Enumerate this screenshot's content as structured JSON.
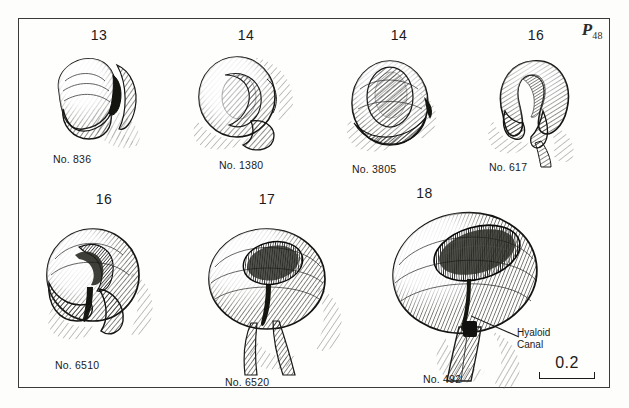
{
  "plate": {
    "mark_prefix": "P",
    "mark_number": "48"
  },
  "figures": [
    {
      "stage": "13",
      "specimen": "No. 836",
      "shape": "optic-vesicle-lateral",
      "description": "Optic vesicle, stage 13"
    },
    {
      "stage": "14",
      "specimen": "No. 1380",
      "shape": "optic-vesicle-invaginating",
      "description": "Optic vesicle beginning invagination, stage 14"
    },
    {
      "stage": "14",
      "specimen": "No. 3805",
      "shape": "optic-vesicle-lens-placode",
      "description": "Optic vesicle with lens placode, stage 14"
    },
    {
      "stage": "16",
      "specimen": "No. 617",
      "shape": "optic-cup-horseshoe",
      "description": "Optic cup, horseshoe form, stage 16"
    },
    {
      "stage": "16",
      "specimen": "No. 6510",
      "shape": "optic-cup-choroid-fissure",
      "description": "Optic cup with choroid fissure, stage 16"
    },
    {
      "stage": "17",
      "specimen": "No. 6520",
      "shape": "optic-cup-lens-vesicle",
      "description": "Optic cup with lens vesicle, stage 17"
    },
    {
      "stage": "18",
      "specimen": "No. 492",
      "shape": "optic-cup-large",
      "description": "Optic cup and stalk, stage 18"
    }
  ],
  "annotation": {
    "line1": "Hyaloid",
    "line2": "Canal"
  },
  "scale": {
    "value": "0.2"
  },
  "colors": {
    "ink": "#1b1b1a",
    "frame": "#3a3a38",
    "paper": "#fefefd",
    "shadow": "#8d8d8a"
  }
}
